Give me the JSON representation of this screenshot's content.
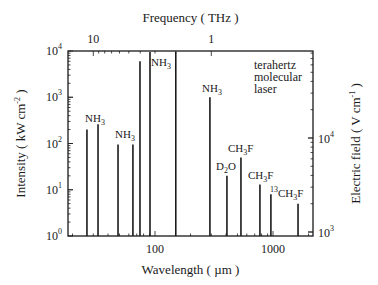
{
  "chart_data": {
    "type": "bar",
    "subtype": "stick-spectrum",
    "title": "",
    "xlabel": "Wavelength ( µm )",
    "ylabel": "Intensity ( kW cm-2 )",
    "ylabel_parts": {
      "base": "Intensity ( kW cm",
      "sup": "-2",
      "end": " )"
    },
    "top_xlabel": "Frequency ( THz )",
    "right_ylabel": "Electric field ( V cm-1 )",
    "right_ylabel_parts": {
      "base": "Electric field ( V cm",
      "sup": "-1",
      "end": " )"
    },
    "xscale": "log",
    "yscale": "log",
    "xlim": [
      18,
      2170
    ],
    "ylim": [
      1,
      10000
    ],
    "x_ticks": [
      {
        "value": 100,
        "label": "100"
      },
      {
        "value": 1000,
        "label": "1000"
      }
    ],
    "y_ticks": [
      {
        "value": 1,
        "base": "10",
        "exp": "0"
      },
      {
        "value": 10,
        "base": "10",
        "exp": "1"
      },
      {
        "value": 100,
        "base": "10",
        "exp": "2"
      },
      {
        "value": 1000,
        "base": "10",
        "exp": "3"
      },
      {
        "value": 10000,
        "base": "10",
        "exp": "4"
      }
    ],
    "top_ticks": [
      {
        "frequency_thz": 10,
        "wavelength_um": 30,
        "label": "10"
      },
      {
        "frequency_thz": 1,
        "wavelength_um": 300,
        "label": "1"
      }
    ],
    "right_ticks": [
      {
        "base": "10",
        "exp": "3",
        "y_px": 232
      },
      {
        "base": "10",
        "exp": "4",
        "y_px": 138
      }
    ],
    "grid": false,
    "legend": null,
    "annotation": [
      "terahertz",
      "molecular",
      "laser"
    ],
    "x": [
      26.5,
      32.9,
      48.6,
      65,
      74.6,
      90.7,
      150,
      292,
      407,
      535,
      775,
      960,
      1630
    ],
    "values": [
      200,
      260,
      95,
      95,
      6000,
      10000,
      10000,
      1000,
      20,
      50,
      13,
      8,
      5
    ],
    "line_labels": [
      {
        "text": "NH",
        "sub": "3",
        "pre": "",
        "x_px": 87,
        "y_px": 122
      },
      {
        "text": "NH",
        "sub": "3",
        "pre": "",
        "x_px": 117,
        "y_px": 138
      },
      {
        "text": "NH",
        "sub": "3",
        "pre": "",
        "x_px": 153,
        "y_px": 66
      },
      {
        "text": "NH",
        "sub": "3",
        "pre": "",
        "x_px": 204,
        "y_px": 92
      },
      {
        "text": "CH",
        "sub": "3",
        "after": "F",
        "pre": "",
        "x_px": 230,
        "y_px": 152
      },
      {
        "text": "D",
        "sub": "2",
        "after": "O",
        "pre": "",
        "x_px": 218,
        "y_px": 170
      },
      {
        "text": "CH",
        "sub": "3",
        "after": "F",
        "pre": "",
        "x_px": 250,
        "y_px": 179
      },
      {
        "text": "CH",
        "sub": "3",
        "after": "F",
        "pre": "13",
        "x_px": 272,
        "y_px": 197
      }
    ]
  },
  "colors": {
    "ink": "#1a1a1a",
    "background": "#ffffff"
  }
}
